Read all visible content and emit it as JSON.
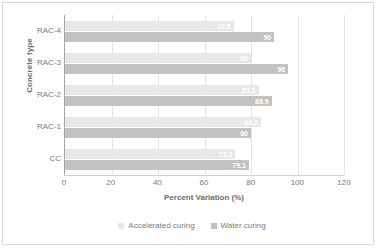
{
  "chart_data": {
    "type": "bar",
    "orientation": "horizontal",
    "title": "",
    "xlabel": "Percent Variation (%)",
    "ylabel": "Concrete type",
    "categories": [
      "RAC-4",
      "RAC-3",
      "RAC-2",
      "RAC-1",
      "CC"
    ],
    "series": [
      {
        "name": "Accelerated curing",
        "color": "#e8e8e8",
        "values": [
          72.5,
          80,
          83.3,
          84.2,
          73.3
        ],
        "labels": [
          "72.5",
          "80",
          "83.3",
          "84.2",
          "73.3"
        ]
      },
      {
        "name": "Water curing",
        "color": "#c2c2c2",
        "values": [
          90,
          96,
          88.9,
          80,
          79.1
        ],
        "labels": [
          "90",
          "96",
          "88.9",
          "80",
          "79.1"
        ]
      }
    ],
    "xlim": [
      0,
      120
    ],
    "xticks": [
      0,
      20,
      40,
      60,
      80,
      100,
      120
    ],
    "xtick_labels": [
      "0",
      "20",
      "40",
      "60",
      "80",
      "100",
      "120"
    ],
    "grid": true,
    "grid_axis": "x",
    "legend_position": "bottom"
  },
  "style": {
    "axis_text_color": "#7a7a7a",
    "axis_title_color": "#6d6d6d",
    "gridline_color": "#e4e4e4",
    "frame_color": "#d9d9d9",
    "data_label_color": "#ffffff"
  }
}
